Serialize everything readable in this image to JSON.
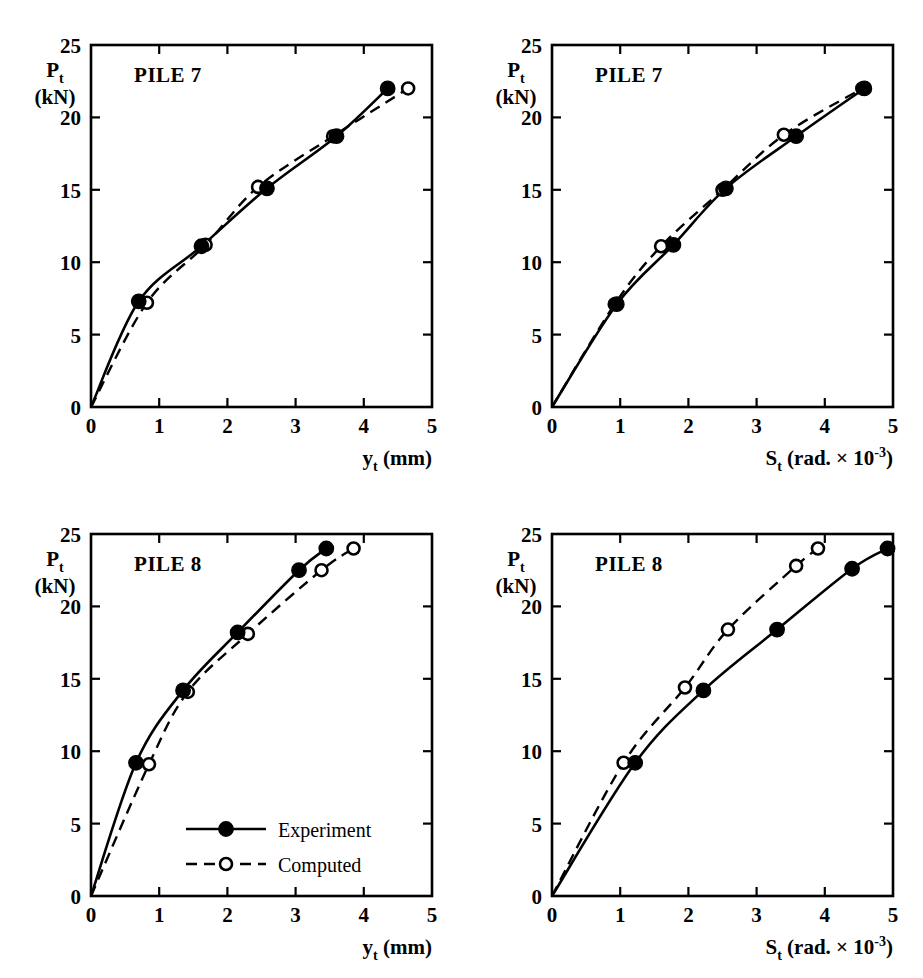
{
  "figure": {
    "panel_count": 4,
    "line_color": "#000000",
    "background_color": "#ffffff"
  },
  "legend": {
    "experiment_label": "Experiment",
    "computed_label": "Computed",
    "experiment_marker": "filled-circle",
    "computed_marker": "open-circle",
    "experiment_linestyle": "solid",
    "computed_linestyle": "dashed",
    "position": "inside bottom-left panel, lower right"
  },
  "axis_text": {
    "y_title_main": "P",
    "y_title_sub": "t",
    "y_title_unit": "(kN)",
    "x_title_disp_main": "y",
    "x_title_disp_sub": "t",
    "x_title_disp_unit": "(mm)",
    "x_title_rot_main": "S",
    "x_title_rot_sub": "t",
    "x_title_rot_unit": "(rad. × 10",
    "x_title_rot_exp": "-3",
    "x_title_rot_close": ")"
  },
  "chart_data": [
    {
      "id": "pile7-displacement",
      "type": "line",
      "title": "PILE 7",
      "xlabel": "y_t (mm)",
      "ylabel": "P_t (kN)",
      "xlim": [
        0,
        5
      ],
      "ylim": [
        0,
        25
      ],
      "xticks": [
        0,
        1,
        2,
        3,
        4,
        5
      ],
      "yticks": [
        0,
        5,
        10,
        15,
        20,
        25
      ],
      "grid": false,
      "legend_position": "none",
      "series": [
        {
          "name": "Experiment",
          "marker": "filled-circle",
          "linestyle": "solid",
          "x": [
            0.0,
            0.7,
            1.62,
            2.58,
            3.6,
            4.35
          ],
          "y": [
            0.0,
            7.3,
            11.1,
            15.1,
            18.7,
            22.0
          ]
        },
        {
          "name": "Computed",
          "marker": "open-circle",
          "linestyle": "dashed",
          "x": [
            0.0,
            0.82,
            1.68,
            2.45,
            3.55,
            4.65
          ],
          "y": [
            0.0,
            7.2,
            11.2,
            15.2,
            18.7,
            22.0
          ]
        }
      ]
    },
    {
      "id": "pile7-rotation",
      "type": "line",
      "title": "PILE 7",
      "xlabel": "S_t (rad. × 10^-3)",
      "ylabel": "P_t (kN)",
      "xlim": [
        0,
        5
      ],
      "ylim": [
        0,
        25
      ],
      "xticks": [
        0,
        1,
        2,
        3,
        4,
        5
      ],
      "yticks": [
        0,
        5,
        10,
        15,
        20,
        25
      ],
      "grid": false,
      "legend_position": "none",
      "series": [
        {
          "name": "Experiment",
          "marker": "filled-circle",
          "linestyle": "solid",
          "x": [
            0.0,
            0.95,
            1.78,
            2.55,
            3.58,
            4.58
          ],
          "y": [
            0.0,
            7.1,
            11.2,
            15.1,
            18.7,
            22.0
          ]
        },
        {
          "name": "Computed",
          "marker": "open-circle",
          "linestyle": "dashed",
          "x": [
            0.0,
            0.92,
            1.6,
            2.5,
            3.4,
            4.55
          ],
          "y": [
            0.0,
            7.1,
            11.1,
            15.0,
            18.8,
            22.0
          ]
        }
      ]
    },
    {
      "id": "pile8-displacement",
      "type": "line",
      "title": "PILE 8",
      "xlabel": "y_t (mm)",
      "ylabel": "P_t (kN)",
      "xlim": [
        0,
        5
      ],
      "ylim": [
        0,
        25
      ],
      "xticks": [
        0,
        1,
        2,
        3,
        4,
        5
      ],
      "yticks": [
        0,
        5,
        10,
        15,
        20,
        25
      ],
      "grid": false,
      "legend_position": "inside lower-right",
      "series": [
        {
          "name": "Experiment",
          "marker": "filled-circle",
          "linestyle": "solid",
          "x": [
            0.0,
            0.66,
            1.35,
            2.15,
            3.05,
            3.45
          ],
          "y": [
            0.0,
            9.2,
            14.2,
            18.2,
            22.5,
            24.0
          ]
        },
        {
          "name": "Computed",
          "marker": "open-circle",
          "linestyle": "dashed",
          "x": [
            0.0,
            0.85,
            1.42,
            2.3,
            3.38,
            3.85
          ],
          "y": [
            0.0,
            9.1,
            14.1,
            18.1,
            22.5,
            24.0
          ]
        }
      ]
    },
    {
      "id": "pile8-rotation",
      "type": "line",
      "title": "PILE 8",
      "xlabel": "S_t (rad. × 10^-3)",
      "ylabel": "P_t (kN)",
      "xlim": [
        0,
        5
      ],
      "ylim": [
        0,
        25
      ],
      "xticks": [
        0,
        1,
        2,
        3,
        4,
        5
      ],
      "yticks": [
        0,
        5,
        10,
        15,
        20,
        25
      ],
      "grid": false,
      "legend_position": "none",
      "series": [
        {
          "name": "Experiment",
          "marker": "filled-circle",
          "linestyle": "solid",
          "x": [
            0.0,
            1.22,
            2.22,
            3.3,
            4.4,
            4.92
          ],
          "y": [
            0.0,
            9.2,
            14.2,
            18.4,
            22.6,
            24.0
          ]
        },
        {
          "name": "Computed",
          "marker": "open-circle",
          "linestyle": "dashed",
          "x": [
            0.0,
            1.05,
            1.95,
            2.58,
            3.58,
            3.9
          ],
          "y": [
            0.0,
            9.2,
            14.4,
            18.4,
            22.8,
            24.0
          ]
        }
      ]
    }
  ]
}
